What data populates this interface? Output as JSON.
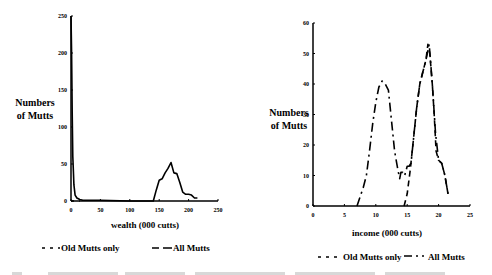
{
  "chart_data": [
    {
      "type": "line",
      "title": "",
      "xlabel": "wealth (000 cutts)",
      "ylabel_lines": [
        "Numbers",
        "of Mutts"
      ],
      "xlim": [
        0,
        250
      ],
      "ylim": [
        0,
        250
      ],
      "xticks": [
        0,
        50,
        100,
        150,
        200,
        250
      ],
      "yticks": [
        0,
        50,
        100,
        150,
        200,
        250
      ],
      "grid": false,
      "legend": {
        "placement": "bottom",
        "entries": [
          "Old Mutts only",
          "All Mutts"
        ]
      },
      "series": [
        {
          "name": "Old Mutts only",
          "style": "dashed",
          "x": [
            0,
            1,
            2,
            3,
            4,
            5,
            7,
            10,
            15
          ],
          "y": [
            0,
            0,
            0,
            0,
            0,
            0,
            0,
            0,
            0
          ]
        },
        {
          "name": "All Mutts",
          "style": "solid",
          "x": [
            0,
            1,
            2,
            3,
            4,
            5,
            7,
            10,
            15,
            20,
            30,
            50,
            100,
            140,
            145,
            150,
            155,
            160,
            165,
            170,
            175,
            180,
            185,
            190,
            195,
            200,
            205,
            210,
            215
          ],
          "y": [
            250,
            200,
            120,
            60,
            40,
            22,
            8,
            4,
            2,
            1,
            1,
            1,
            0,
            0,
            15,
            28,
            30,
            38,
            44,
            52,
            38,
            37,
            25,
            12,
            9,
            9,
            8,
            4,
            4
          ]
        }
      ]
    },
    {
      "type": "line",
      "title": "",
      "xlabel": "income (000 cutts)",
      "ylabel_lines": [
        "Numbers",
        "of Mutts"
      ],
      "xlim": [
        0,
        25
      ],
      "ylim": [
        0,
        60
      ],
      "xticks": [
        0,
        5,
        10,
        15,
        20,
        25
      ],
      "yticks": [
        0,
        10,
        20,
        30,
        40,
        50,
        60
      ],
      "grid": false,
      "legend": {
        "placement": "bottom",
        "entries": [
          "Old Mutts only",
          "All Mutts"
        ]
      },
      "series": [
        {
          "name": "Old Mutts only",
          "style": "dashed",
          "x": [
            14.5,
            15,
            15.5,
            16,
            16.5,
            17,
            17.5,
            18,
            18.3,
            18.6,
            19,
            19.3,
            19.6,
            20,
            20.5,
            21,
            21.5
          ],
          "y": [
            0,
            4,
            12,
            22,
            32,
            40,
            44,
            48,
            53,
            50,
            40,
            30,
            18,
            15,
            14,
            10,
            4
          ]
        },
        {
          "name": "All Mutts",
          "style": "dash-dot",
          "x": [
            7,
            7.5,
            8,
            8.5,
            9,
            9.5,
            10,
            10.5,
            11,
            11.5,
            12,
            12.5,
            13,
            13.5,
            13.8,
            14,
            14.3,
            14.6,
            15,
            15.3,
            15.6,
            16,
            16.5,
            17,
            17.5,
            18,
            18.5,
            19,
            19.5,
            20,
            20.5,
            21,
            21.5
          ],
          "y": [
            0,
            3,
            6,
            10,
            18,
            27,
            34,
            39,
            41,
            40,
            38,
            28,
            18,
            12,
            9,
            11,
            11,
            10,
            13,
            13,
            14,
            22,
            32,
            40,
            44,
            48,
            53,
            40,
            24,
            15,
            14,
            10,
            4
          ]
        }
      ]
    }
  ]
}
